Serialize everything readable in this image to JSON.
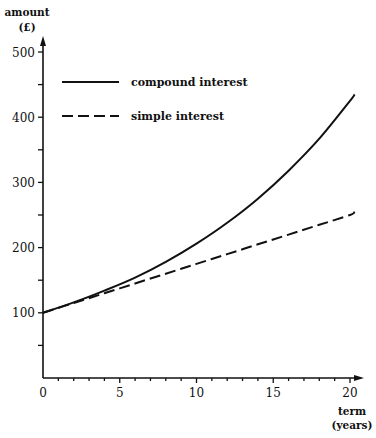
{
  "chart_data": {
    "type": "line",
    "title": "",
    "ylabel": "amount",
    "ylabel_unit": "(£)",
    "xlabel": "term",
    "xlabel_unit": "(years)",
    "xlim": [
      0,
      20.5
    ],
    "ylim": [
      0,
      500
    ],
    "x_ticks": [
      0,
      5,
      10,
      15,
      20
    ],
    "x_tick_labels": [
      "0",
      "5",
      "10",
      "15",
      "20"
    ],
    "x_minor_ticks_every": 1,
    "y_ticks": [
      100,
      200,
      300,
      400,
      500
    ],
    "y_tick_labels": [
      "100",
      "200",
      "300",
      "400",
      "500"
    ],
    "y_minor_ticks_every": 50,
    "grid": false,
    "legend_position": "upper-left (inside)",
    "x": [
      0,
      2,
      4,
      6,
      8,
      10,
      12,
      14,
      16,
      18,
      20,
      20.3
    ],
    "series": [
      {
        "name": "compound interest",
        "style": "solid",
        "values": [
          100,
          116,
          134,
          154,
          178,
          206,
          238,
          275,
          318,
          367,
          425,
          435
        ]
      },
      {
        "name": "simple interest",
        "style": "dashed",
        "values": [
          100,
          115,
          130,
          145,
          160,
          175,
          190,
          205,
          220,
          235,
          250,
          255
        ]
      }
    ]
  }
}
